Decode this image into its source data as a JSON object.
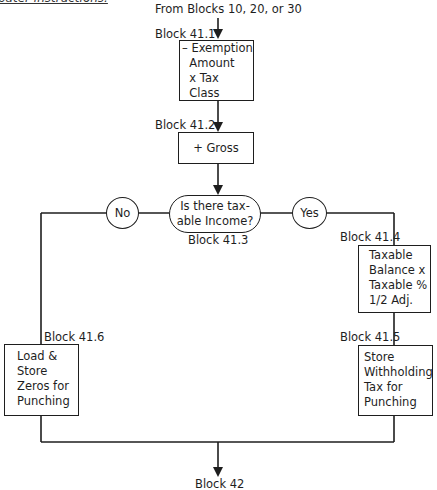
{
  "header_fragment": "pater instructions.",
  "entry": {
    "label": "From Blocks 10, 20, or 30"
  },
  "blocks": {
    "b41_1": {
      "id": "Block 41.1",
      "text": "– Exemption\n  Amount\n  x Tax\n  Class"
    },
    "b41_2": {
      "id": "Block 41.2",
      "text": "+ Gross"
    },
    "b41_3": {
      "id": "Block 41.3",
      "text": "Is there tax-\nable Income?"
    },
    "b41_4": {
      "id": "Block 41.4",
      "text": "Taxable\nBalance x\nTaxable %\n1/2 Adj."
    },
    "b41_5": {
      "id": "Block 41.5",
      "text": "Store\nWithholding\nTax for\nPunching"
    },
    "b41_6": {
      "id": "Block 41.6",
      "text": "Load &\nStore\nZeros for\nPunching"
    }
  },
  "branches": {
    "no": "No",
    "yes": "Yes"
  },
  "exit": {
    "label": "Block 42"
  },
  "colors": {
    "line": "#1e1e1e",
    "background": "#ffffff"
  }
}
